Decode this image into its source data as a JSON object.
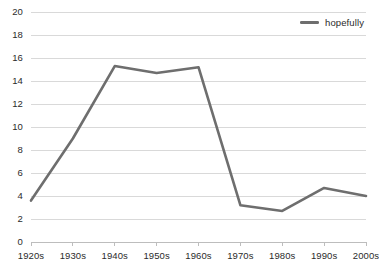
{
  "chart_data": {
    "type": "line",
    "title": "",
    "subtitle": "",
    "xlabel": "",
    "ylabel": "",
    "categories": [
      "1920s",
      "1930s",
      "1940s",
      "1950s",
      "1960s",
      "1970s",
      "1980s",
      "1990s",
      "2000s"
    ],
    "series": [
      {
        "name": "hopefully",
        "color": "#6e6e6e",
        "values": [
          3.6,
          9.0,
          15.3,
          14.7,
          15.2,
          3.2,
          2.7,
          4.7,
          4.0
        ]
      }
    ],
    "ylim": [
      0,
      20
    ],
    "yticks": [
      0,
      2,
      4,
      6,
      8,
      10,
      12,
      14,
      16,
      18,
      20
    ],
    "ytick_labels": [
      "0",
      "2",
      "4",
      "6",
      "8",
      "10",
      "12",
      "14",
      "16",
      "18",
      "20"
    ],
    "xtick_labels": [
      "1920s",
      "1930s",
      "1940s",
      "1950s",
      "1960s",
      "1970s",
      "1980s",
      "1990s",
      "2000s"
    ],
    "grid": {
      "horizontal": true,
      "vertical": false,
      "color": "#d9d9d9"
    },
    "legend": {
      "position": "top-right",
      "entries": [
        {
          "label": "hopefully",
          "color": "#6e6e6e",
          "swatch": "line-swatch"
        }
      ]
    },
    "axis": {
      "baseline_color": "#bdbdbd",
      "tick_color": "#bdbdbd",
      "label_color": "#2b2b2b"
    },
    "line_style": {
      "width": 2.6,
      "cap": "round",
      "join": "round",
      "markers": "none"
    }
  },
  "geometry": {
    "plot_left": 31,
    "plot_right": 366,
    "plot_top": 12,
    "plot_bottom": 242
  }
}
